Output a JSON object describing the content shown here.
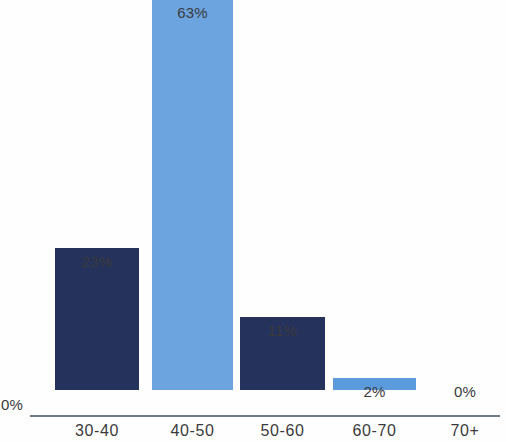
{
  "chart_data": {
    "type": "bar",
    "title": "",
    "subtitle": "",
    "xlabel": "",
    "ylabel": "",
    "categories": [
      "30-40",
      "40-50",
      "50-60",
      "60-70",
      "70+"
    ],
    "values": [
      23,
      63,
      11,
      2,
      0
    ],
    "value_labels": [
      "23%",
      "63%",
      "11%",
      "2%",
      "0%"
    ],
    "bar_colors": [
      "#25325C",
      "#6CA4E0",
      "#25325C",
      "#5B9BDC",
      "#FEFEFE"
    ],
    "ylim": [
      0,
      63
    ],
    "grid": false,
    "legend": "none",
    "axis_color": "#6E7A8A",
    "label_color": "#3A3A3A",
    "background": "#FEFEFE",
    "axis_origin_label": "0%"
  },
  "axis": {
    "origin_label": "0%"
  },
  "bars": [
    {
      "category": "30-40",
      "value": 23,
      "label": "23%",
      "color": "#25325C",
      "left": 55,
      "width": 84,
      "height": 142,
      "label_left": 55,
      "label_width": 84,
      "label_top": 253
    },
    {
      "category": "40-50",
      "value": 63,
      "label": "63%",
      "color": "#6CA4E0",
      "left": 152,
      "width": 81,
      "height": 391,
      "label_left": 150,
      "label_width": 85,
      "label_top": 4
    },
    {
      "category": "50-60",
      "value": 11,
      "label": "11%",
      "color": "#25325C",
      "left": 240,
      "width": 85,
      "height": 73,
      "label_left": 240,
      "label_width": 85,
      "label_top": 322
    },
    {
      "category": "60-70",
      "value": 2,
      "label": "2%",
      "color": "#5B9BDC",
      "left": 333,
      "width": 83,
      "height": 12,
      "label_left": 333,
      "label_width": 83,
      "label_top": 383
    },
    {
      "category": "70+",
      "value": 0,
      "label": "0%",
      "color": "#FEFEFE",
      "left": 430,
      "width": 70,
      "height": 0,
      "label_left": 430,
      "label_width": 70,
      "label_top": 383
    }
  ],
  "category_labels": [
    {
      "text": "30-40",
      "left": 55,
      "width": 84
    },
    {
      "text": "40-50",
      "left": 150,
      "width": 85
    },
    {
      "text": "50-60",
      "left": 240,
      "width": 85
    },
    {
      "text": "60-70",
      "left": 333,
      "width": 83
    },
    {
      "text": "70+",
      "left": 430,
      "width": 70
    }
  ]
}
